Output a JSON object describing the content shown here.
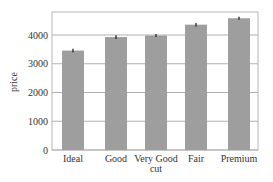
{
  "chart_data": {
    "type": "bar",
    "title": "",
    "xlabel": "cut",
    "ylabel": "price",
    "categories": [
      "Ideal",
      "Good",
      "Very Good",
      "Fair",
      "Premium"
    ],
    "values": [
      3458,
      3929,
      3982,
      4359,
      4584
    ],
    "error": [
      60,
      65,
      50,
      60,
      55
    ],
    "ylim": [
      0,
      4800
    ],
    "yticks": [
      0,
      1000,
      2000,
      3000,
      4000
    ],
    "grid": true,
    "legend": null,
    "colors": {
      "bar": "#9e9e9e",
      "grid": "#b0b0b0",
      "errorbar": "#222222",
      "frame": "#b5b5b5"
    }
  }
}
